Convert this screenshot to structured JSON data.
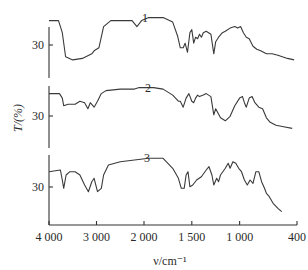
{
  "chart_data": {
    "type": "line",
    "title": "",
    "xlabel": "ν/cm⁻¹",
    "ylabel": "T/(%)",
    "x_ticks": [
      "4 000",
      "3 000",
      "2 000",
      "1 500",
      "1 000",
      "400"
    ],
    "x_tick_values": [
      4000,
      3000,
      2000,
      1500,
      1000,
      400
    ],
    "x_range": [
      4000,
      400
    ],
    "x_reversed": true,
    "x_scale_note": "split scale: 4000-2000 compressed, 2000-400 expanded",
    "y_tick_label": "30",
    "grid": false,
    "legend": "none (curves labelled 1, 2, 3 inline)",
    "layout": "three stacked offset panels sharing x axis",
    "series": [
      {
        "name": "1",
        "label": "1",
        "description": "IR transmittance spectrum 1",
        "points": [
          [
            4000,
            38
          ],
          [
            3800,
            38
          ],
          [
            3720,
            30
          ],
          [
            3650,
            14
          ],
          [
            3500,
            12
          ],
          [
            3300,
            13
          ],
          [
            3100,
            16
          ],
          [
            3050,
            18
          ],
          [
            2950,
            20
          ],
          [
            2850,
            34
          ],
          [
            2700,
            38
          ],
          [
            2500,
            38
          ],
          [
            2250,
            38
          ],
          [
            2150,
            34
          ],
          [
            2050,
            38
          ],
          [
            1950,
            40
          ],
          [
            1800,
            40
          ],
          [
            1700,
            37
          ],
          [
            1650,
            28
          ],
          [
            1620,
            20
          ],
          [
            1590,
            20
          ],
          [
            1570,
            23
          ],
          [
            1545,
            17
          ],
          [
            1520,
            30
          ],
          [
            1500,
            32
          ],
          [
            1480,
            23
          ],
          [
            1460,
            27
          ],
          [
            1440,
            26
          ],
          [
            1420,
            29
          ],
          [
            1400,
            27
          ],
          [
            1380,
            30
          ],
          [
            1350,
            31
          ],
          [
            1300,
            29
          ],
          [
            1270,
            16
          ],
          [
            1250,
            24
          ],
          [
            1220,
            27
          ],
          [
            1180,
            30
          ],
          [
            1150,
            31
          ],
          [
            1100,
            33
          ],
          [
            1050,
            34
          ],
          [
            1020,
            33
          ],
          [
            990,
            34
          ],
          [
            960,
            30
          ],
          [
            930,
            27
          ],
          [
            900,
            26
          ],
          [
            860,
            21
          ],
          [
            820,
            19
          ],
          [
            780,
            18
          ],
          [
            720,
            16
          ],
          [
            660,
            16
          ],
          [
            600,
            15
          ],
          [
            500,
            13
          ],
          [
            430,
            12
          ]
        ]
      },
      {
        "name": "2",
        "label": "2",
        "description": "IR transmittance spectrum 2",
        "points": [
          [
            4000,
            36
          ],
          [
            3780,
            36
          ],
          [
            3720,
            33
          ],
          [
            3690,
            28
          ],
          [
            3600,
            29
          ],
          [
            3450,
            29
          ],
          [
            3350,
            31
          ],
          [
            3250,
            30
          ],
          [
            3180,
            26
          ],
          [
            3130,
            30
          ],
          [
            3050,
            27
          ],
          [
            2980,
            31
          ],
          [
            2900,
            36
          ],
          [
            2800,
            38
          ],
          [
            2500,
            39
          ],
          [
            2200,
            39
          ],
          [
            2100,
            40
          ],
          [
            1900,
            40
          ],
          [
            1800,
            39
          ],
          [
            1700,
            35
          ],
          [
            1640,
            31
          ],
          [
            1620,
            31
          ],
          [
            1590,
            27
          ],
          [
            1560,
            33
          ],
          [
            1530,
            36
          ],
          [
            1500,
            31
          ],
          [
            1480,
            30
          ],
          [
            1460,
            33
          ],
          [
            1440,
            35
          ],
          [
            1420,
            34
          ],
          [
            1380,
            35
          ],
          [
            1350,
            36
          ],
          [
            1300,
            34
          ],
          [
            1270,
            22
          ],
          [
            1250,
            26
          ],
          [
            1200,
            20
          ],
          [
            1150,
            18
          ],
          [
            1100,
            21
          ],
          [
            1050,
            28
          ],
          [
            1000,
            33
          ],
          [
            970,
            34
          ],
          [
            950,
            30
          ],
          [
            930,
            27
          ],
          [
            900,
            33
          ],
          [
            870,
            34
          ],
          [
            840,
            30
          ],
          [
            800,
            27
          ],
          [
            760,
            26
          ],
          [
            720,
            20
          ],
          [
            680,
            17
          ],
          [
            620,
            15
          ],
          [
            540,
            14
          ],
          [
            450,
            13
          ]
        ]
      },
      {
        "name": "3",
        "label": "3",
        "description": "IR transmittance spectrum 3",
        "points": [
          [
            4000,
            32
          ],
          [
            3760,
            33
          ],
          [
            3720,
            27
          ],
          [
            3690,
            22
          ],
          [
            3640,
            30
          ],
          [
            3560,
            32
          ],
          [
            3450,
            32
          ],
          [
            3350,
            30
          ],
          [
            3250,
            24
          ],
          [
            3170,
            20
          ],
          [
            3100,
            26
          ],
          [
            3050,
            28
          ],
          [
            2980,
            20
          ],
          [
            2900,
            22
          ],
          [
            2850,
            30
          ],
          [
            2750,
            36
          ],
          [
            2500,
            38
          ],
          [
            2200,
            39
          ],
          [
            1950,
            40
          ],
          [
            1800,
            40
          ],
          [
            1700,
            34
          ],
          [
            1640,
            28
          ],
          [
            1610,
            22
          ],
          [
            1580,
            22
          ],
          [
            1560,
            30
          ],
          [
            1540,
            32
          ],
          [
            1520,
            23
          ],
          [
            1490,
            24
          ],
          [
            1450,
            27
          ],
          [
            1400,
            29
          ],
          [
            1350,
            33
          ],
          [
            1320,
            35
          ],
          [
            1290,
            30
          ],
          [
            1270,
            24
          ],
          [
            1240,
            28
          ],
          [
            1220,
            26
          ],
          [
            1200,
            30
          ],
          [
            1150,
            34
          ],
          [
            1120,
            37
          ],
          [
            1100,
            34
          ],
          [
            1070,
            38
          ],
          [
            1040,
            37
          ],
          [
            1010,
            34
          ],
          [
            980,
            32
          ],
          [
            950,
            27
          ],
          [
            920,
            24
          ],
          [
            890,
            27
          ],
          [
            860,
            25
          ],
          [
            830,
            32
          ],
          [
            800,
            32
          ],
          [
            770,
            26
          ],
          [
            740,
            22
          ],
          [
            720,
            19
          ],
          [
            690,
            17
          ],
          [
            650,
            13
          ],
          [
            600,
            10
          ],
          [
            560,
            8
          ]
        ]
      }
    ]
  }
}
